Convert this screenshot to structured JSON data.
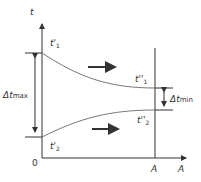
{
  "diagram": {
    "axis_y_label": "t",
    "axis_x_label": "A",
    "origin_label": "0",
    "section_label": "A",
    "t1_in": {
      "main": "t'",
      "sub": "1"
    },
    "t2_in": {
      "main": "t'",
      "sub": "2"
    },
    "t1_out": {
      "main": "t''",
      "sub": "1"
    },
    "t2_out": {
      "main": "t''",
      "sub": "2"
    },
    "delta_max": {
      "main": "Δt",
      "sub": "max"
    },
    "delta_min": {
      "main": "Δt",
      "sub": "min"
    },
    "flow_direction": "right",
    "colors": {
      "line": "#333333",
      "curve": "#777777",
      "background": "#ffffff"
    }
  }
}
